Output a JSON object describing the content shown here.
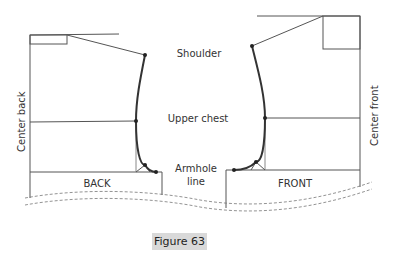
{
  "diagram": {
    "labels": {
      "shoulder": "Shoulder",
      "upper_chest": "Upper chest",
      "armhole_line_1": "Armhole",
      "armhole_line_2": "line",
      "center_back": "Center back",
      "center_front": "Center front",
      "back": "BACK",
      "front": "FRONT"
    },
    "caption": "Figure 63",
    "colors": {
      "line": "#555555",
      "curve": "#333333",
      "caption_bg": "#d9d9d9",
      "text": "#333333"
    }
  }
}
